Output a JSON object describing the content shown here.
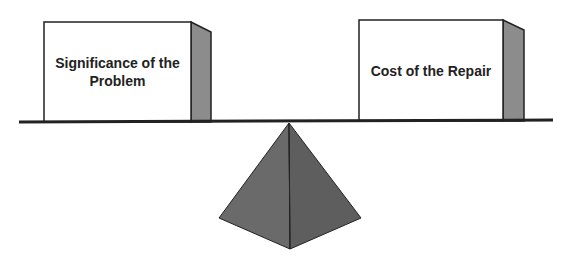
{
  "diagram": {
    "type": "balance-scale",
    "left_weight": {
      "label": "Significance of the Problem"
    },
    "right_weight": {
      "label": "Cost of the Repair"
    },
    "colors": {
      "box_face": "#ffffff",
      "box_side": "#8c8c8c",
      "outline": "#222222",
      "fulcrum_left": "#6a6a6a",
      "fulcrum_right": "#5e5e5e"
    }
  }
}
